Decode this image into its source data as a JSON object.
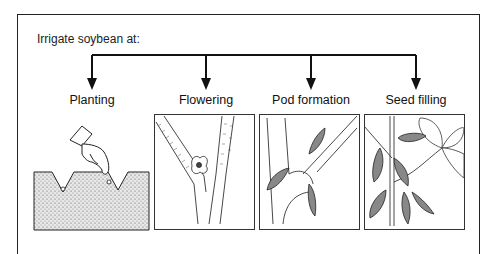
{
  "diagram": {
    "title": "Irrigate soybean at:",
    "stages": [
      {
        "label": "Planting",
        "illustration": "hand-dropping-seed-into-furrow"
      },
      {
        "label": "Flowering",
        "illustration": "flower-at-stem-node"
      },
      {
        "label": "Pod formation",
        "illustration": "young-pods-on-stem"
      },
      {
        "label": "Seed filling",
        "illustration": "mature-pods-and-trifoliate-leaf"
      }
    ],
    "colors": {
      "line": "#111111",
      "soil": "#d9d9d9",
      "background": "#ffffff"
    }
  }
}
